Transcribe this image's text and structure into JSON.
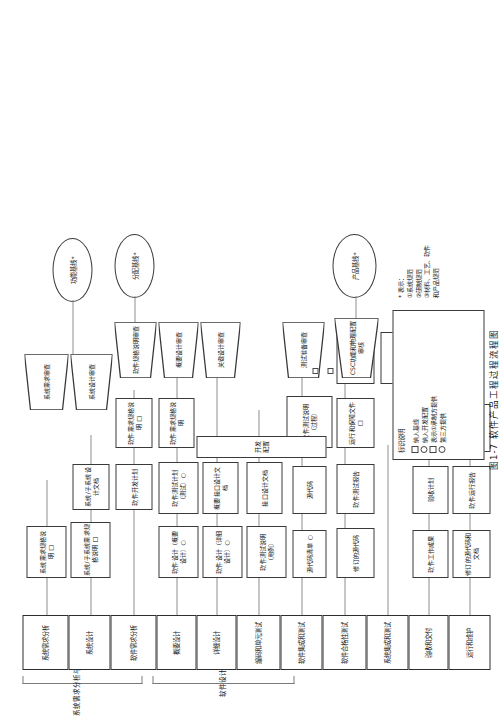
{
  "figure": {
    "caption": "图1-7  软件产品工程过程流程图"
  },
  "groups": [
    {
      "label": "系统需求分析与设计"
    },
    {
      "label": "软件设计"
    }
  ],
  "phases": [
    {
      "id": "p1",
      "label": "系统需求分析"
    },
    {
      "id": "p2",
      "label": "系统设计"
    },
    {
      "id": "p3",
      "label": "软件需求分析"
    },
    {
      "id": "p4",
      "label": "概要设计"
    },
    {
      "id": "p5",
      "label": "详细设计"
    },
    {
      "id": "p6",
      "label": "编码和单元测试"
    },
    {
      "id": "p7",
      "label": "软件集成和测试"
    },
    {
      "id": "p8",
      "label": "软件合格性测试"
    },
    {
      "id": "p9",
      "label": "系统集成和测试"
    },
    {
      "id": "p10",
      "label": "验收和交付"
    },
    {
      "id": "p11",
      "label": "运行和维护"
    }
  ],
  "artifacts": [
    {
      "id": "a1",
      "label": "系统需求规格说明 □"
    },
    {
      "id": "a2",
      "label": "系统/子系统需求规格说明 □"
    },
    {
      "id": "a3",
      "label": "系统/子系统设计文档"
    },
    {
      "id": "a4",
      "label": "软件开发计划"
    },
    {
      "id": "a5",
      "label": "软件需求规格说明 □"
    },
    {
      "id": "a6",
      "label": "软件需求规格说明"
    },
    {
      "id": "a7",
      "label": "软件设计（概要设计）○"
    },
    {
      "id": "a8",
      "label": "软件测试计划（测试）○"
    },
    {
      "id": "a9",
      "label": "概要接口设计文档"
    },
    {
      "id": "a10",
      "label": "软件设计（详细设计）○"
    },
    {
      "id": "a11",
      "label": "软件测试说明（用例）"
    },
    {
      "id": "a12",
      "label": "接口设计文档"
    },
    {
      "id": "a13",
      "label": "源代码清单 ○"
    },
    {
      "id": "a14",
      "label": "源代码"
    },
    {
      "id": "a15",
      "label": "软件测试说明（过程）"
    },
    {
      "id": "a16",
      "label": "修订的源代码"
    },
    {
      "id": "a17",
      "label": "软件测试报告"
    },
    {
      "id": "a18",
      "label": "运行和保障文件 □"
    },
    {
      "id": "a19",
      "label": "版本说明文档"
    },
    {
      "id": "a20",
      "label": "软件产品规格说明 □"
    },
    {
      "id": "a21",
      "label": "修订的源代码和文档"
    },
    {
      "id": "a22",
      "label": "软件运行报告"
    },
    {
      "id": "a23",
      "label": "软件维护报告"
    },
    {
      "id": "a24",
      "label": "软件工作成果"
    },
    {
      "id": "a25",
      "label": "验收计划"
    },
    {
      "id": "a26",
      "label": "验收报告"
    },
    {
      "id": "a27",
      "label": "开发配置"
    }
  ],
  "reviews": [
    {
      "id": "r1",
      "label": "系统需求审查"
    },
    {
      "id": "r2",
      "label": "系统设计审查"
    },
    {
      "id": "r3",
      "label": "软件规格说明审查"
    },
    {
      "id": "r4",
      "label": "概要设计审查"
    },
    {
      "id": "r5",
      "label": "关键设计审查"
    },
    {
      "id": "r6",
      "label": "测试准备审查"
    },
    {
      "id": "r7",
      "label": "CSC功能和物理配置审核"
    }
  ],
  "baselines": [
    {
      "id": "b1",
      "label": "功能基线*"
    },
    {
      "id": "b2",
      "label": "分配基线*"
    },
    {
      "id": "b3",
      "label": "产品基线*"
    }
  ],
  "legend": {
    "title": "标识说明",
    "items": [
      {
        "glyph": "square",
        "text": "纳入基线"
      },
      {
        "glyph": "circle",
        "text": "纳入开发配置"
      },
      {
        "glyph": "square",
        "text": "表示①承制方提供"
      },
      {
        "glyph": "circle",
        "text": "第三方提供"
      }
    ]
  },
  "note": {
    "header": "* 表示：",
    "lines": [
      "①系统规范",
      "②研制规范",
      "③材料、工艺、软件",
      "   和产品规范"
    ]
  }
}
